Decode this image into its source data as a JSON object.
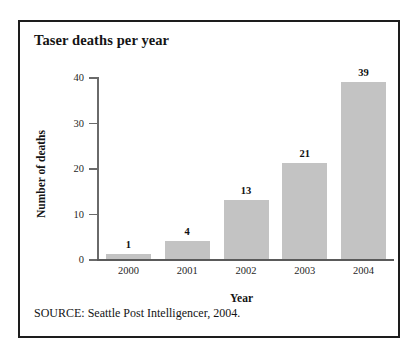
{
  "figure": {
    "title": "Taser deaths per year",
    "source_note": "SOURCE: Seattle Post Intelligencer, 2004.",
    "border_color": "#1d1d1d",
    "background_color": "#ffffff"
  },
  "chart_data": {
    "type": "bar",
    "title": "Taser deaths per year",
    "xlabel": "Year",
    "ylabel": "Number of deaths",
    "categories": [
      "2000",
      "2001",
      "2002",
      "2003",
      "2004"
    ],
    "values": [
      1,
      4,
      13,
      21,
      39
    ],
    "value_labels": [
      "1",
      "4",
      "13",
      "21",
      "39"
    ],
    "ylim": [
      0,
      40
    ],
    "yticks": [
      0,
      10,
      20,
      30,
      40
    ],
    "ytick_labels": [
      "0",
      "10",
      "20",
      "30",
      "40"
    ],
    "grid": false,
    "legend": false,
    "bar_color": "#c3c3c3",
    "axis_color": "#5a5a5a"
  }
}
